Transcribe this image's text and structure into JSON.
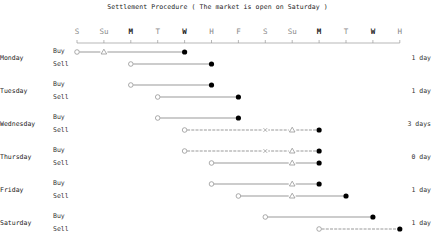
{
  "title": "Settlement Procedure ( The market is open on Saturday )",
  "axis": {
    "labels": [
      "S",
      "Su",
      "M",
      "T",
      "W",
      "H",
      "F",
      "S",
      "Su",
      "M",
      "T",
      "W",
      "H"
    ],
    "strong": [
      false,
      false,
      true,
      false,
      true,
      false,
      false,
      false,
      false,
      true,
      false,
      true,
      false
    ],
    "x0": 77,
    "step": 26.9,
    "y": 43
  },
  "legend": {
    "open_circle": "order/trade date",
    "triangle": "holiday (non-trading)",
    "cross": "skipped day",
    "filled_circle": "settlement date"
  },
  "colors": {
    "line": "#555555",
    "marker_open": "#888888",
    "marker_filled": "#000000",
    "text": "#222222"
  },
  "rows": [
    {
      "day": "Monday",
      "duration": "1 day",
      "buy": {
        "label": "Buy",
        "y": 52,
        "start": 0,
        "end": 4,
        "marks": [
          {
            "type": "triangle",
            "pos": 1
          }
        ],
        "dashed": false
      },
      "sell": {
        "label": "Sell",
        "y": 64,
        "start": 2,
        "end": 5,
        "marks": [],
        "dashed": false
      }
    },
    {
      "day": "Tuesday",
      "duration": "1 day",
      "buy": {
        "label": "Buy",
        "y": 85,
        "start": 2,
        "end": 5,
        "marks": [],
        "dashed": false
      },
      "sell": {
        "label": "Sell",
        "y": 97,
        "start": 3,
        "end": 6,
        "marks": [],
        "dashed": false
      }
    },
    {
      "day": "Wednesday",
      "duration": "3 days",
      "buy": {
        "label": "Buy",
        "y": 118,
        "start": 3,
        "end": 6,
        "marks": [],
        "dashed": false
      },
      "sell": {
        "label": "Sell",
        "y": 130,
        "start": 4,
        "end": 9,
        "marks": [
          {
            "type": "cross",
            "pos": 7
          },
          {
            "type": "triangle",
            "pos": 8
          }
        ],
        "dashed": true
      }
    },
    {
      "day": "Thursday",
      "duration": "0 day",
      "buy": {
        "label": "Buy",
        "y": 151,
        "start": 4,
        "end": 9,
        "marks": [
          {
            "type": "cross",
            "pos": 7
          },
          {
            "type": "triangle",
            "pos": 8
          }
        ],
        "dashed": true
      },
      "sell": {
        "label": "Sell",
        "y": 163,
        "start": 5,
        "end": 9,
        "marks": [
          {
            "type": "triangle",
            "pos": 8
          }
        ],
        "dashed": false
      }
    },
    {
      "day": "Friday",
      "duration": "1 day",
      "buy": {
        "label": "Buy",
        "y": 184,
        "start": 5,
        "end": 9,
        "marks": [
          {
            "type": "triangle",
            "pos": 8
          }
        ],
        "dashed": false
      },
      "sell": {
        "label": "Sell",
        "y": 196,
        "start": 6,
        "end": 10,
        "marks": [
          {
            "type": "triangle",
            "pos": 8
          }
        ],
        "dashed": false
      }
    },
    {
      "day": "Saturday",
      "duration": "1 day",
      "buy": {
        "label": "Buy",
        "y": 217,
        "start": 7,
        "end": 11,
        "marks": [],
        "dashed": false
      },
      "sell": {
        "label": "Sell",
        "y": 229,
        "start": 9,
        "end": 12,
        "marks": [],
        "dashed": true
      }
    }
  ]
}
